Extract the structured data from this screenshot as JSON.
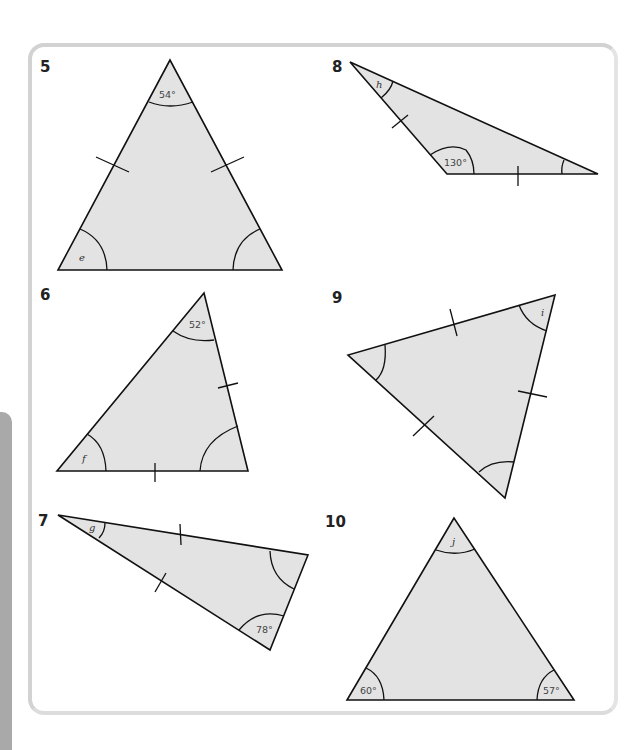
{
  "page": {
    "frame_color": "#d2d2d2",
    "shape_fill": "#e3e3e3",
    "side_tab_color": "#a9a9a9"
  },
  "questions": [
    {
      "number": "5",
      "type": "isosceles",
      "known_angles": [
        "54°"
      ],
      "unknown": "e",
      "equal_sides_marked": 2
    },
    {
      "number": "6",
      "type": "isosceles",
      "known_angles": [
        "52°"
      ],
      "unknown": "f",
      "equal_sides_marked": 2
    },
    {
      "number": "7",
      "type": "isosceles",
      "known_angles": [
        "78°"
      ],
      "unknown": "g",
      "equal_sides_marked": 2
    },
    {
      "number": "8",
      "type": "isosceles",
      "known_angles": [
        "130°"
      ],
      "unknown": "h",
      "equal_sides_marked": 2
    },
    {
      "number": "9",
      "type": "equilateral",
      "known_angles": [],
      "unknown": "i",
      "equal_sides_marked": 3
    },
    {
      "number": "10",
      "type": "scalene",
      "known_angles": [
        "60°",
        "57°"
      ],
      "unknown": "j",
      "equal_sides_marked": 0
    }
  ]
}
